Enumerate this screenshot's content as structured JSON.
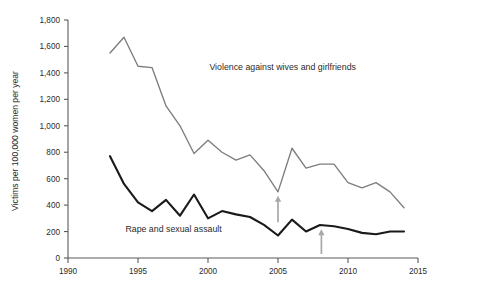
{
  "chart_data": {
    "type": "line",
    "title": "",
    "xlabel": "",
    "ylabel": "Victims per 100,000 women per year",
    "xlim": [
      1990,
      2015
    ],
    "ylim": [
      0,
      1800
    ],
    "grid": false,
    "legend_position": "inline-annotations",
    "xticks": [
      "1990",
      "1995",
      "2000",
      "2005",
      "2010",
      "2015"
    ],
    "xtick_values": [
      1990,
      1995,
      2000,
      2005,
      2010,
      2015
    ],
    "yticks": [
      "0",
      "200",
      "400",
      "600",
      "800",
      "1,000",
      "1,200",
      "1,400",
      "1,600",
      "1,800"
    ],
    "ytick_values": [
      0,
      200,
      400,
      600,
      800,
      1000,
      1200,
      1400,
      1600,
      1800
    ],
    "x": [
      1993,
      1994,
      1995,
      1996,
      1997,
      1998,
      1999,
      2000,
      2001,
      2002,
      2003,
      2004,
      2005,
      2006,
      2007,
      2008,
      2009,
      2010,
      2011,
      2012,
      2013,
      2014
    ],
    "series": [
      {
        "name": "Violence against wives and girlfriends",
        "color": "#7d7d7d",
        "label_x": 2000.1,
        "label_y": 1420,
        "values": [
          1550,
          1670,
          1450,
          1440,
          1150,
          1000,
          790,
          890,
          800,
          740,
          780,
          660,
          500,
          830,
          680,
          710,
          710,
          570,
          530,
          570,
          500,
          380
        ]
      },
      {
        "name": "Rape and sexual assault",
        "color": "#1a1a1a",
        "label_x": 1994.1,
        "label_y": 195,
        "values": [
          770,
          560,
          420,
          355,
          440,
          320,
          480,
          300,
          355,
          330,
          310,
          250,
          170,
          290,
          200,
          250,
          240,
          220,
          190,
          180,
          200,
          200
        ]
      }
    ],
    "annotations": [
      {
        "name": "arrow-violence-2005",
        "x": 2005,
        "y_base": 270,
        "y_tip": 470,
        "color": "#a8a8a8"
      },
      {
        "name": "arrow-rape-2008",
        "x": 2008.1,
        "y_base": 30,
        "y_tip": 218,
        "color": "#a8a8a8"
      }
    ]
  }
}
